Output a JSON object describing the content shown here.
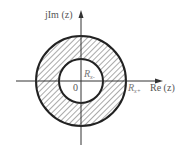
{
  "diagram": {
    "axes": {
      "imag_label": "jIm (z)",
      "real_label": "Re (z)",
      "origin_label": "0"
    },
    "region": {
      "inner_radius_label": "Rx-",
      "outer_radius_label": "Rx+",
      "inner_radius_text": "R",
      "inner_radius_sub": "x-",
      "outer_radius_text": "R",
      "outer_radius_sub": "x+",
      "fill_pattern": "diagonal-hatch",
      "stroke_color": "#222222",
      "hatch_color": "#555555"
    }
  }
}
